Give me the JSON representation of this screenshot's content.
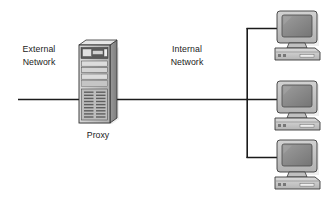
{
  "diagram": {
    "type": "network-topology",
    "background_color": "#ffffff",
    "line_color": "#1b1b1b",
    "labels": {
      "external_network": "External\nNetwork",
      "external_network_line1": "External",
      "external_network_line2": "Network",
      "internal_network_line1": "Internal",
      "internal_network_line2": "Network",
      "proxy": "Proxy"
    },
    "nodes": {
      "proxy_server": {
        "name": "Proxy",
        "icon": "tower-server-icon",
        "body_color": "#c9c9c9",
        "side_color": "#8f8f8f",
        "top_color": "#e3e3e3",
        "bay_color": "#d7d7d7",
        "dark_panel_color": "#4a4a4a"
      },
      "clients": [
        {
          "icon": "desktop-computer-icon",
          "label": ""
        },
        {
          "icon": "desktop-computer-icon",
          "label": ""
        },
        {
          "icon": "desktop-computer-icon",
          "label": ""
        }
      ],
      "client_colors": {
        "monitor_case": "#c4c4c4",
        "monitor_shade": "#9a9a9a",
        "screen": "#8c8c8c",
        "screen_highlight": "#a6a6a6",
        "base_unit": "#cfcfcf",
        "base_shade": "#9a9a9a",
        "outline": "#3a3a3a"
      }
    },
    "links": {
      "bus_segment_label": "network bus",
      "trunk_label": "internal network trunk",
      "drop_count": 3
    }
  }
}
